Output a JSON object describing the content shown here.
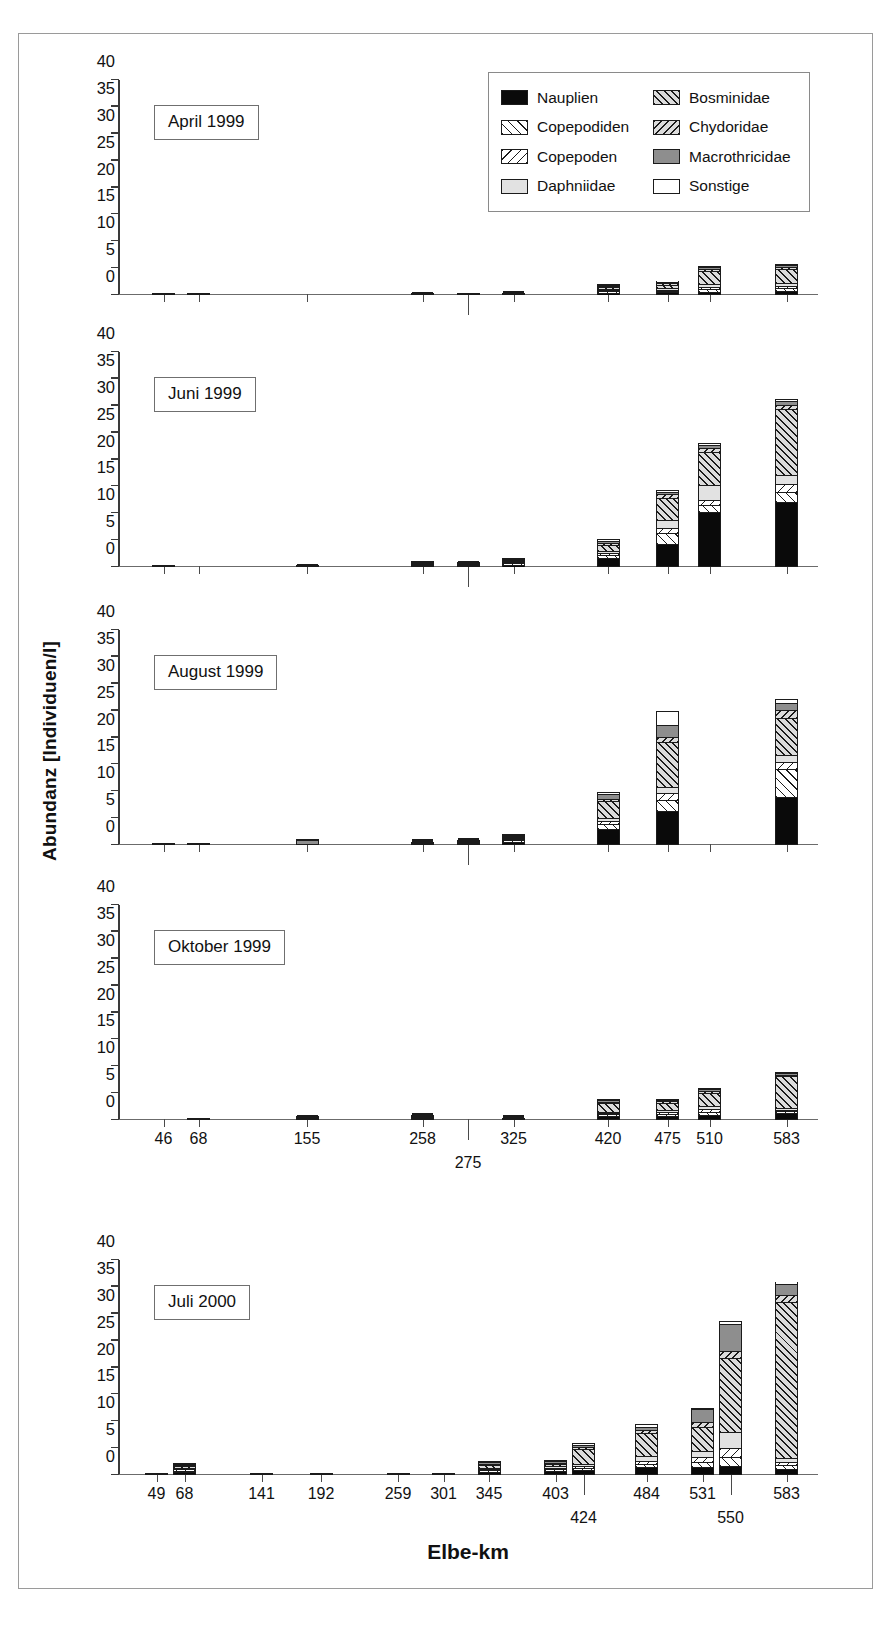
{
  "axis": {
    "ylabel": "Abundanz [Individuen/l]",
    "xlabel": "Elbe-km",
    "yticks": [
      0,
      5,
      10,
      15,
      20,
      25,
      30,
      35,
      40
    ],
    "ylim": [
      0,
      40
    ]
  },
  "legend": {
    "items": [
      {
        "label": "Nauplien",
        "key": "nauplien",
        "color": "#0a0a0a",
        "pattern": "solid-black"
      },
      {
        "label": "Copepodiden",
        "key": "copepodiden",
        "color": "#ffffff",
        "pattern": "hatch-forward-light"
      },
      {
        "label": "Copepoden",
        "key": "copepoden",
        "color": "#ffffff",
        "pattern": "hatch-back-light"
      },
      {
        "label": "Daphniidae",
        "key": "daphniidae",
        "color": "#e2e2e2",
        "pattern": "solid-lightgray"
      },
      {
        "label": "Bosminidae",
        "key": "bosminidae",
        "color": "#dcdcdc",
        "pattern": "hatch-forward-gray"
      },
      {
        "label": "Chydoridae",
        "key": "chydoridae",
        "color": "#dcdcdc",
        "pattern": "hatch-back-gray"
      },
      {
        "label": "Macrothricidae",
        "key": "macrothricidae",
        "color": "#8e8e8e",
        "pattern": "solid-gray"
      },
      {
        "label": "Sonstige",
        "key": "sonstige",
        "color": "#ffffff",
        "pattern": "solid-white"
      }
    ]
  },
  "chart_data": {
    "type": "bar",
    "subtype": "stacked",
    "title": "",
    "xlabel": "Elbe-km",
    "ylabel": "Abundanz [Individuen/l]",
    "ylim": [
      0,
      40
    ],
    "yticks": [
      0,
      5,
      10,
      15,
      20,
      25,
      30,
      35,
      40
    ],
    "grid": false,
    "legend_position": "top-right (panel 1)",
    "series_order": [
      "nauplien",
      "copepodiden",
      "copepoden",
      "daphniidae",
      "bosminidae",
      "chydoridae",
      "macrothricidae",
      "sonstige"
    ],
    "panels": [
      {
        "label": "April 1999",
        "categories": [
          "46",
          "68",
          "155",
          "258",
          "275",
          "325",
          "420",
          "475",
          "510",
          "583"
        ],
        "series": [
          {
            "name": "Nauplien",
            "values": [
              0.25,
              0.05,
              0.0,
              0.1,
              0.1,
              0.2,
              0.35,
              0.3,
              0.4,
              0.45
            ]
          },
          {
            "name": "Copepodiden",
            "values": [
              0.0,
              0.0,
              0.0,
              0.05,
              0.0,
              0.05,
              0.3,
              0.25,
              0.45,
              0.55
            ]
          },
          {
            "name": "Copepoden",
            "values": [
              0.0,
              0.0,
              0.0,
              0.0,
              0.0,
              0.0,
              0.1,
              0.15,
              0.25,
              0.3
            ]
          },
          {
            "name": "Daphniidae",
            "values": [
              0.0,
              0.0,
              0.0,
              0.0,
              0.0,
              0.0,
              0.05,
              0.1,
              0.5,
              0.6
            ]
          },
          {
            "name": "Bosminidae",
            "values": [
              0.0,
              0.0,
              0.0,
              0.0,
              0.0,
              0.0,
              0.95,
              1.4,
              3.2,
              3.3
            ]
          },
          {
            "name": "Chydoridae",
            "values": [
              0.0,
              0.0,
              0.0,
              0.0,
              0.0,
              0.0,
              0.1,
              0.15,
              0.2,
              0.2
            ]
          },
          {
            "name": "Macrothricidae",
            "values": [
              0.1,
              0.0,
              0.0,
              0.0,
              0.0,
              0.05,
              0.2,
              0.25,
              0.3,
              0.3
            ]
          },
          {
            "name": "Sonstige",
            "values": [
              0.0,
              0.0,
              0.0,
              0.3,
              0.15,
              0.15,
              0.05,
              0.1,
              0.1,
              0.1
            ]
          }
        ],
        "totals": [
          0.35,
          0.05,
          0.0,
          0.45,
          0.25,
          0.45,
          2.1,
          2.7,
          5.4,
          5.8
        ]
      },
      {
        "label": "Juni 1999",
        "categories": [
          "46",
          "68",
          "155",
          "258",
          "275",
          "325",
          "420",
          "475",
          "510",
          "583"
        ],
        "series": [
          {
            "name": "Nauplien",
            "values": [
              0.1,
              0.0,
              0.2,
              0.55,
              0.4,
              0.8,
              1.8,
              4.5,
              10.6,
              12.3
            ]
          },
          {
            "name": "Copepodiden",
            "values": [
              0.0,
              0.0,
              0.05,
              0.25,
              0.2,
              0.3,
              0.6,
              2.1,
              1.3,
              1.8
            ]
          },
          {
            "name": "Copepoden",
            "values": [
              0.0,
              0.0,
              0.0,
              0.1,
              0.1,
              0.15,
              0.3,
              0.8,
              0.7,
              1.4
            ]
          },
          {
            "name": "Daphniidae",
            "values": [
              0.0,
              0.0,
              0.0,
              0.05,
              0.05,
              0.1,
              0.3,
              1.5,
              2.9,
              1.7
            ]
          },
          {
            "name": "Bosminidae",
            "values": [
              0.0,
              0.0,
              0.0,
              0.0,
              0.0,
              0.1,
              1.4,
              4.4,
              6.4,
              12.7
            ]
          },
          {
            "name": "Chydoridae",
            "values": [
              0.0,
              0.0,
              0.0,
              0.0,
              0.0,
              0.0,
              0.25,
              0.5,
              0.5,
              0.6
            ]
          },
          {
            "name": "Macrothricidae",
            "values": [
              0.0,
              0.0,
              0.0,
              0.05,
              0.05,
              0.1,
              0.4,
              0.4,
              0.5,
              0.5
            ]
          },
          {
            "name": "Sonstige",
            "values": [
              0.0,
              0.0,
              0.1,
              0.15,
              0.2,
              0.1,
              0.15,
              0.2,
              0.2,
              0.2
            ]
          }
        ],
        "totals": [
          0.1,
          0.0,
          0.35,
          1.15,
          1.0,
          1.65,
          5.2,
          14.4,
          23.1,
          31.2
        ]
      },
      {
        "label": "August 1999",
        "categories": [
          "46",
          "68",
          "155",
          "258",
          "275",
          "325",
          "420",
          "475",
          "510",
          "583"
        ],
        "series": [
          {
            "name": "Nauplien",
            "values": [
              0.1,
              0.05,
              0.0,
              0.3,
              0.55,
              1.2,
              3.1,
              6.4,
              0.0,
              9.2
            ]
          },
          {
            "name": "Copepodiden",
            "values": [
              0.0,
              0.0,
              0.0,
              0.1,
              0.1,
              0.2,
              1.0,
              2.0,
              0.0,
              5.2
            ]
          },
          {
            "name": "Copepoden",
            "values": [
              0.0,
              0.0,
              0.0,
              0.05,
              0.05,
              0.15,
              0.4,
              1.2,
              0.0,
              1.2
            ]
          },
          {
            "name": "Daphniidae",
            "values": [
              0.0,
              0.0,
              0.0,
              0.05,
              0.05,
              0.15,
              0.35,
              1.0,
              0.0,
              1.3
            ]
          },
          {
            "name": "Bosminidae",
            "values": [
              0.0,
              0.0,
              0.0,
              0.0,
              0.05,
              0.15,
              3.6,
              8.8,
              0.0,
              7.1
            ]
          },
          {
            "name": "Chydoridae",
            "values": [
              0.0,
              0.0,
              0.0,
              0.0,
              0.0,
              0.05,
              0.2,
              0.8,
              0.0,
              1.3
            ]
          },
          {
            "name": "Macrothricidae",
            "values": [
              0.0,
              0.0,
              1.1,
              0.05,
              0.05,
              0.1,
              0.9,
              2.1,
              0.0,
              1.3
            ]
          },
          {
            "name": "Sonstige",
            "values": [
              0.0,
              0.0,
              0.1,
              0.1,
              0.1,
              0.1,
              0.25,
              2.7,
              0.0,
              0.5
            ]
          }
        ],
        "totals": [
          0.1,
          0.05,
          1.2,
          0.65,
          0.95,
          2.1,
          9.8,
          25.0,
          0.0,
          27.1
        ]
      },
      {
        "label": "Oktober 1999",
        "categories": [
          "46",
          "68",
          "155",
          "258",
          "275",
          "325",
          "420",
          "475",
          "510",
          "583"
        ],
        "series": [
          {
            "name": "Nauplien",
            "values": [
              0.0,
              0.35,
              0.4,
              0.45,
              0.0,
              0.1,
              0.75,
              0.7,
              0.8,
              1.1
            ]
          },
          {
            "name": "Copepodiden",
            "values": [
              0.0,
              0.0,
              0.05,
              0.15,
              0.0,
              0.05,
              0.1,
              0.35,
              0.55,
              0.2
            ]
          },
          {
            "name": "Copepoden",
            "values": [
              0.0,
              0.0,
              0.0,
              0.05,
              0.0,
              0.0,
              0.05,
              0.2,
              0.4,
              0.15
            ]
          },
          {
            "name": "Daphniidae",
            "values": [
              0.0,
              0.0,
              0.0,
              0.05,
              0.0,
              0.0,
              0.1,
              0.25,
              0.7,
              0.2
            ]
          },
          {
            "name": "Bosminidae",
            "values": [
              0.0,
              0.0,
              0.1,
              0.1,
              0.0,
              0.05,
              2.6,
              2.1,
              3.1,
              7.0
            ]
          },
          {
            "name": "Chydoridae",
            "values": [
              0.0,
              0.0,
              0.0,
              0.0,
              0.0,
              0.0,
              0.1,
              0.1,
              0.1,
              0.15
            ]
          },
          {
            "name": "Macrothricidae",
            "values": [
              0.0,
              0.0,
              0.15,
              0.1,
              0.0,
              0.05,
              0.15,
              0.2,
              0.2,
              0.15
            ]
          },
          {
            "name": "Sonstige",
            "values": [
              0.0,
              0.0,
              0.1,
              0.1,
              0.0,
              0.1,
              0.05,
              0.1,
              0.15,
              0.05
            ]
          }
        ],
        "totals": [
          0.0,
          0.35,
          0.8,
          1.0,
          0.0,
          0.35,
          3.9,
          4.0,
          6.0,
          9.0
        ]
      },
      {
        "label": "Juli 2000",
        "categories": [
          "49",
          "68",
          "141",
          "192",
          "259",
          "301",
          "345",
          "403",
          "424",
          "484",
          "531",
          "550",
          "583"
        ],
        "series": [
          {
            "name": "Nauplien",
            "values": [
              0.4,
              0.6,
              0.2,
              0.1,
              0.3,
              0.25,
              0.7,
              0.8,
              0.7,
              1.3,
              1.2,
              1.4,
              0.8
            ]
          },
          {
            "name": "Copepodiden",
            "values": [
              0.0,
              0.3,
              0.0,
              0.0,
              0.0,
              0.0,
              0.2,
              0.35,
              0.35,
              0.6,
              1.0,
              1.5,
              0.5
            ]
          },
          {
            "name": "Copepoden",
            "values": [
              0.0,
              0.2,
              0.0,
              0.0,
              0.0,
              0.0,
              0.15,
              0.25,
              0.2,
              0.4,
              0.7,
              1.6,
              0.5
            ]
          },
          {
            "name": "Daphniidae",
            "values": [
              0.0,
              0.3,
              0.0,
              0.0,
              0.0,
              0.0,
              0.2,
              0.3,
              0.2,
              0.8,
              1.2,
              3.1,
              0.6
            ]
          },
          {
            "name": "Bosminidae",
            "values": [
              0.0,
              0.4,
              0.0,
              0.0,
              0.0,
              0.0,
              0.9,
              0.5,
              3.6,
              5.1,
              5.0,
              14.4,
              30.2
            ]
          },
          {
            "name": "Chydoridae",
            "values": [
              0.0,
              0.2,
              0.0,
              0.0,
              0.0,
              0.0,
              0.15,
              0.25,
              0.3,
              0.5,
              0.8,
              1.2,
              1.1
            ]
          },
          {
            "name": "Macrothricidae",
            "values": [
              0.0,
              0.15,
              0.0,
              0.0,
              0.0,
              0.0,
              0.15,
              0.2,
              0.25,
              0.4,
              2.5,
              5.0,
              2.1
            ]
          },
          {
            "name": "Sonstige",
            "values": [
              0.0,
              0.15,
              0.0,
              0.0,
              0.0,
              0.0,
              0.15,
              0.2,
              0.4,
              0.3,
              0.1,
              0.4,
              0.2
            ]
          }
        ],
        "totals": [
          0.4,
          2.3,
          0.2,
          0.1,
          0.3,
          0.25,
          2.6,
          2.85,
          6.0,
          9.4,
          12.5,
          28.6,
          36.0
        ]
      }
    ]
  }
}
